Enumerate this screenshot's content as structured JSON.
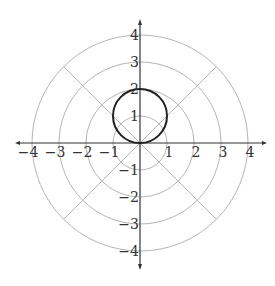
{
  "diagram": {
    "type": "polar-grid",
    "center_px": [
      140,
      143
    ],
    "unit_px": 27,
    "rings": [
      1,
      2,
      3,
      4
    ],
    "ray_angles_deg": [
      45,
      135
    ],
    "colors": {
      "grid": "#b5b5b5",
      "axis": "#333333",
      "curve": "#222222"
    },
    "x_ticks": [
      {
        "value": -4,
        "label": "−4"
      },
      {
        "value": -3,
        "label": "−3"
      },
      {
        "value": -2,
        "label": "−2"
      },
      {
        "value": -1,
        "label": "−1"
      },
      {
        "value": 1,
        "label": "1"
      },
      {
        "value": 2,
        "label": "2"
      },
      {
        "value": 3,
        "label": "3"
      },
      {
        "value": 4,
        "label": "4"
      }
    ],
    "y_ticks": [
      {
        "value": 4,
        "label": "4"
      },
      {
        "value": 3,
        "label": "3"
      },
      {
        "value": 2,
        "label": "2"
      },
      {
        "value": 1,
        "label": "1"
      },
      {
        "value": -1,
        "label": "−1"
      },
      {
        "value": -2,
        "label": "−2"
      },
      {
        "value": -3,
        "label": "−3"
      },
      {
        "value": -4,
        "label": "−4"
      }
    ],
    "curve": {
      "description": "circle r = 2 sin(theta)",
      "center": [
        0,
        1
      ],
      "radius": 1
    }
  }
}
